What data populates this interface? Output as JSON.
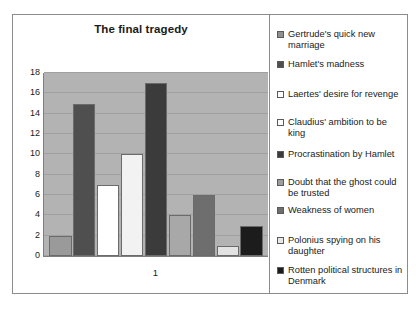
{
  "chart_data": {
    "type": "bar",
    "title": "The final tragedy",
    "xlabel": "1",
    "ylabel": "",
    "categories": [
      "1"
    ],
    "ylim": [
      0,
      18
    ],
    "ytick_labels": [
      "0",
      "2",
      "4",
      "6",
      "8",
      "10",
      "12",
      "14",
      "16",
      "18"
    ],
    "ytick_values": [
      0,
      2,
      4,
      6,
      8,
      10,
      12,
      14,
      16,
      18
    ],
    "grid": true,
    "legend_position": "right",
    "plot_background": "#b3b3b3",
    "series": [
      {
        "name": "Gertrude's quick new marriage",
        "value": 2,
        "color": "#9a9a9a"
      },
      {
        "name": "Hamlet's madness",
        "value": 15,
        "color": "#4f4f4f"
      },
      {
        "name": "Laertes' desire for revenge",
        "value": 7,
        "color": "#ffffff"
      },
      {
        "name": "Claudius' ambition to be king",
        "value": 10,
        "color": "#f2f2f2"
      },
      {
        "name": "Procrastination by Hamlet",
        "value": 17,
        "color": "#3b3b3b"
      },
      {
        "name": "Doubt that the ghost could be trusted",
        "value": 4,
        "color": "#a8a8a8"
      },
      {
        "name": "Weakness of women",
        "value": 6,
        "color": "#6e6e6e"
      },
      {
        "name": "Polonius spying on his daughter",
        "value": 1,
        "color": "#e3e3e3"
      },
      {
        "name": "Rotten political structures in Denmark",
        "value": 3,
        "color": "#1c1c1c"
      }
    ]
  },
  "legend": {
    "items": [
      {
        "label": "Gertrude's quick new marriage",
        "color": "#8f8f8f"
      },
      {
        "label": "Hamlet's madness",
        "color": "#4f4f4f"
      },
      {
        "label": "Laertes' desire for revenge",
        "color": "#ffffff"
      },
      {
        "label": "Claudius' ambition to be king",
        "color": "#fbfbfb"
      },
      {
        "label": "Procrastination by Hamlet",
        "color": "#3b3b3b"
      },
      {
        "label": "Doubt that the ghost could be trusted",
        "color": "#9d9d9d"
      },
      {
        "label": "Weakness of women",
        "color": "#6e6e6e"
      },
      {
        "label": " Polonius spying on his daughter",
        "color": "#e8e8e8"
      },
      {
        "label": "Rotten political structures in Denmark",
        "color": "#1c1c1c"
      }
    ]
  }
}
